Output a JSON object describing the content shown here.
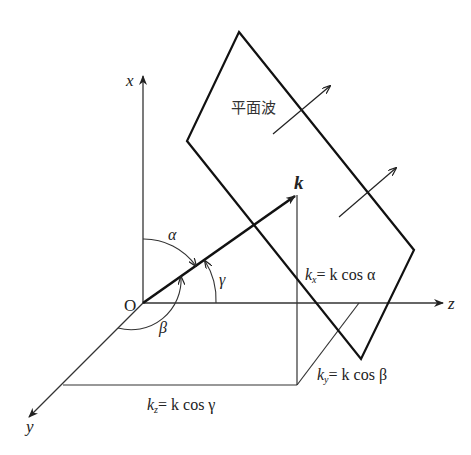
{
  "diagram": {
    "axes": {
      "x": "x",
      "y": "y",
      "z": "z",
      "origin": "O"
    },
    "vector": {
      "label": "k"
    },
    "plane_label": "平面波",
    "angles": {
      "alpha": "α",
      "beta": "β",
      "gamma": "γ"
    },
    "components": {
      "kx": {
        "sym": "k",
        "sub": "x",
        "eq": "= k cos α"
      },
      "ky": {
        "sym": "k",
        "sub": "y",
        "eq": "= k cos β"
      },
      "kz": {
        "sym": "k",
        "sub": "z",
        "eq": "= k cos γ"
      }
    }
  }
}
